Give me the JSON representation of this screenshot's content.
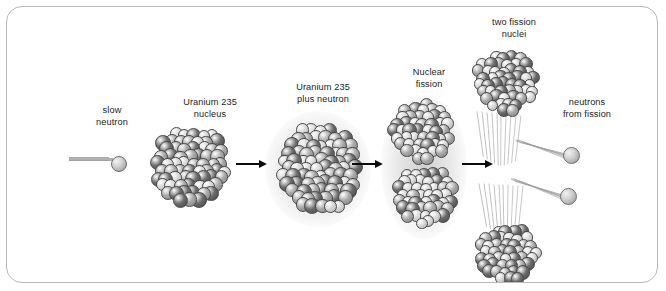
{
  "diagram": {
    "background_color": "#ffffff",
    "border_color": "#b9b9b9",
    "text_color": "#1d1d1d",
    "nucleon_light_color": "#d8d8d8",
    "nucleon_mid_color": "#a9a9a9",
    "nucleon_dark_color": "#6d6d6d",
    "arrow_color": "#0c0c0c"
  },
  "labels": {
    "slow_neutron": "slow\nneutron",
    "uranium_nucleus": "Uranium 235\nnucleus",
    "uranium_plus_neutron": "Uranium 235\nplus neutron",
    "nuclear_fission": "Nuclear\nfission",
    "two_fission_nuclei": "two fission\nnuclei",
    "neutrons_from_fission": "neutrons\nfrom fission"
  },
  "stages": [
    {
      "id": "slow-neutron",
      "label": "slow\nneutron",
      "kind": "neutron"
    },
    {
      "id": "uranium-235-nucleus",
      "label": "Uranium 235\nnucleus",
      "kind": "nucleus",
      "glow": false
    },
    {
      "id": "uranium-plus-neutron",
      "label": "Uranium 235\nplus neutron",
      "kind": "nucleus",
      "glow": true
    },
    {
      "id": "nuclear-fission",
      "label": "Nuclear\nfission",
      "kind": "split-nucleus",
      "glow": true
    },
    {
      "id": "fission-products",
      "label": "two fission\nnuclei",
      "kind": "products"
    }
  ],
  "products": {
    "nuclei_count": 2,
    "neutrons_count": 2,
    "neutrons_label": "neutrons\nfrom fission"
  },
  "arrows": [
    {
      "id": "arrow-1",
      "from": "uranium-235-nucleus",
      "to": "uranium-plus-neutron"
    },
    {
      "id": "arrow-2",
      "from": "uranium-plus-neutron",
      "to": "nuclear-fission"
    },
    {
      "id": "arrow-3",
      "from": "nuclear-fission",
      "to": "fission-products"
    }
  ]
}
